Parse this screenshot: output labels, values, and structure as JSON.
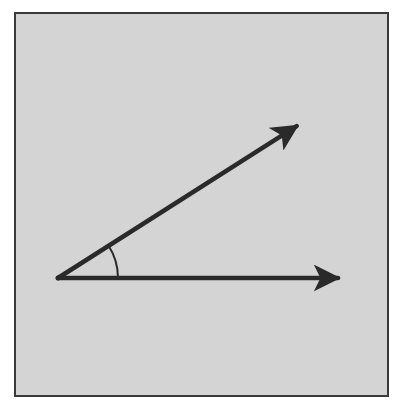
{
  "diagram": {
    "type": "angle",
    "colors": {
      "background": "#d4d4d4",
      "border": "#3a3a3a",
      "stroke": "#2a2a2a"
    },
    "vertex": {
      "x": 58,
      "y": 278
    },
    "rays": [
      {
        "name": "upper-ray",
        "end": {
          "x": 300,
          "y": 124
        }
      },
      {
        "name": "lower-ray",
        "end": {
          "x": 342,
          "y": 278
        }
      }
    ],
    "angle_arc": {
      "radius": 60
    }
  }
}
